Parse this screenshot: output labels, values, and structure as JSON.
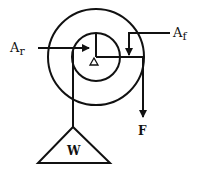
{
  "diagram": {
    "colors": {
      "stroke": "#111111",
      "background": "#ffffff"
    },
    "labels": {
      "resistance_arm": {
        "main": "A",
        "sub": "r"
      },
      "force_arm": {
        "main": "A",
        "sub": "f"
      },
      "force": "F",
      "weight": "W"
    },
    "shapes": {
      "outer_wheel": {
        "cx": 96,
        "cy": 57,
        "r": 48
      },
      "inner_axle": {
        "cx": 96,
        "cy": 57,
        "r": 24
      },
      "fulcrum": "triangle at center",
      "load": "triangle weight"
    }
  }
}
